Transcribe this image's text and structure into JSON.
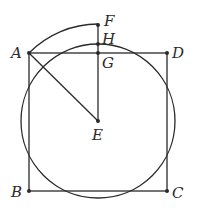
{
  "diagram": {
    "type": "geometry",
    "colors": {
      "stroke": "#2a2a2a",
      "background": "#ffffff"
    },
    "points": {
      "A": {
        "label": "A",
        "x": 29,
        "y": 53
      },
      "B": {
        "label": "B",
        "x": 29,
        "y": 191
      },
      "C": {
        "label": "C",
        "x": 167,
        "y": 191
      },
      "D": {
        "label": "D",
        "x": 167,
        "y": 53
      },
      "E": {
        "label": "E",
        "x": 98,
        "y": 121
      },
      "F": {
        "label": "F",
        "x": 98,
        "y": 25
      },
      "G": {
        "label": "G",
        "x": 98,
        "y": 53
      },
      "H": {
        "label": "H",
        "x": 98,
        "y": 44
      }
    },
    "labels": {
      "A": "A",
      "B": "B",
      "C": "C",
      "D": "D",
      "E": "E",
      "F": "F",
      "G": "G",
      "H": "H"
    },
    "segments": [
      [
        "A",
        "D"
      ],
      [
        "D",
        "C"
      ],
      [
        "C",
        "B"
      ],
      [
        "B",
        "A"
      ],
      [
        "A",
        "E"
      ],
      [
        "E",
        "F"
      ]
    ],
    "circle": {
      "center": "E",
      "through": "H",
      "radius": 77
    },
    "arc": {
      "center": "E",
      "from": "A",
      "to": "F",
      "radius": 97
    }
  }
}
